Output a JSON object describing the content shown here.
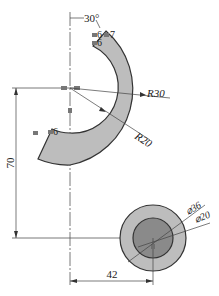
{
  "drawing": {
    "type": "CAD sketch with dimensions and constraints",
    "colors": {
      "background": "#ffffff",
      "line": "#333333",
      "arc_fill": "#bdbdbd",
      "circle_outer_fill": "#bdbdbd",
      "circle_inner_fill": "#8a8a8a"
    },
    "dimensions": {
      "angle": "30°",
      "outer_radius": "R30",
      "inner_radius": "R20",
      "vertical_distance": "70",
      "horizontal_distance": "42",
      "outer_diameter": "⌀36",
      "inner_diameter": "⌀20"
    },
    "constraints": {
      "top_end_a": "6",
      "top_end_b": "7",
      "top_end_c": "6",
      "center_a": "",
      "center_b": "",
      "fixed_marker": "",
      "bottom_end": "6"
    }
  }
}
